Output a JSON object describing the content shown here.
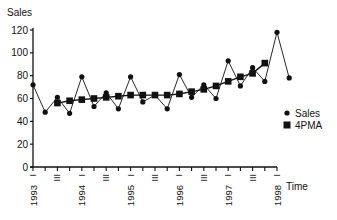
{
  "chart_data": {
    "type": "line",
    "title": "",
    "xlabel": "Time",
    "ylabel": "Sales",
    "ylim": [
      0,
      120
    ],
    "yticks": [
      0,
      20,
      40,
      60,
      80,
      100,
      120
    ],
    "x": [
      "1993 I",
      "1993 II",
      "1993 III",
      "1993 IV",
      "1994 I",
      "1994 II",
      "1994 III",
      "1994 IV",
      "1995 I",
      "1995 II",
      "1995 III",
      "1995 IV",
      "1996 I",
      "1996 II",
      "1996 III",
      "1996 IV",
      "1997 I",
      "1997 II",
      "1997 III",
      "1997 IV",
      "1998 I",
      "1998 II"
    ],
    "year_labels": [
      "1993",
      "1994",
      "1995",
      "1996",
      "1997",
      "1998"
    ],
    "quarter_marks": [
      "I",
      "III"
    ],
    "series": [
      {
        "name": "Sales",
        "marker": "circle",
        "values": [
          72,
          48,
          61,
          47,
          79,
          53,
          65,
          51,
          79,
          57,
          63,
          51,
          81,
          61,
          72,
          60,
          93,
          71,
          87,
          75,
          118,
          78
        ]
      },
      {
        "name": "4PMA",
        "marker": "square",
        "values": [
          null,
          null,
          56,
          58,
          59,
          60,
          61,
          62,
          63,
          63,
          63,
          63,
          64,
          66,
          68,
          71,
          75,
          79,
          82,
          91,
          null,
          null
        ]
      }
    ],
    "legend": {
      "position": "right",
      "entries": [
        "Sales",
        "4PMA"
      ]
    },
    "grid": false
  }
}
